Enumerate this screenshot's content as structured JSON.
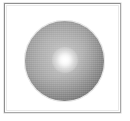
{
  "figure": {
    "kind": "rendered-sphere-figure",
    "caption": "",
    "canvas": {
      "width": 130,
      "height": 121,
      "background_color": "#ffffff"
    },
    "frame": {
      "name": "figure-border",
      "x": 4,
      "y": 3,
      "width": 117,
      "height": 110,
      "fill_color": "#ffffff",
      "border_color_light": "#a8a8a8",
      "border_color_dark": "#8f8f8f",
      "border_width_px": 1,
      "style": "thin-inset-rectangle"
    },
    "sphere": {
      "name": "shaded-sphere",
      "center_x": 63,
      "center_y": 60,
      "radius": 39,
      "bounds": {
        "left": 24,
        "top": 20,
        "right": 103,
        "bottom": 100
      },
      "shading_model": "radial-diffuse-with-specular",
      "base_color": "#ababab",
      "highlight_color": "#ffffff",
      "midtone_color": "#a5a5a5",
      "shadow_color": "#848484",
      "terminator_color": "#6e6e6e",
      "texture": "dithered-grayscale-noise"
    },
    "highlight": {
      "name": "specular-highlight",
      "center_x": 64,
      "center_y": 59,
      "radius": 13,
      "color": "#ffffff",
      "falloff": "soft-gaussian-bloom"
    }
  },
  "labels": {
    "text_elements": [],
    "note": "no text rendered in this image"
  }
}
